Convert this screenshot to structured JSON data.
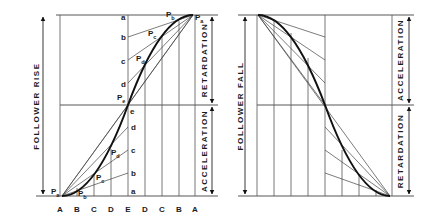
{
  "left_diagram": {
    "title": "FOLLOWER RISE",
    "right_labels": {
      "top": "RETARDATION",
      "bottom": "ACCELERATION"
    },
    "bottom_labels": [
      "A",
      "B",
      "C",
      "D",
      "E",
      "D",
      "C",
      "B",
      "A"
    ],
    "divisions_top": [
      "a",
      "b",
      "c",
      "d",
      "e"
    ],
    "divisions_bottom": [
      "d",
      "c",
      "b",
      "a"
    ],
    "points_top": {
      "Pa": "P",
      "Pa_sub": "a",
      "Pb": "P",
      "Pb_sub": "b",
      "Pc": "P",
      "Pc_sub": "c",
      "Pd": "P",
      "Pd_sub": "d",
      "Pe": "P",
      "Pe_sub": "e"
    },
    "points_bottom": {
      "Pa": "P",
      "Pa_sub": "a",
      "Pb": "P",
      "Pb_sub": "b",
      "Pc": "P",
      "Pc_sub": "c",
      "Pd": "P",
      "Pd_sub": "d"
    }
  },
  "right_diagram": {
    "title": "FOLLOWER FALL",
    "right_labels": {
      "top": "ACCELERATION",
      "bottom": "RETARDATION"
    }
  }
}
